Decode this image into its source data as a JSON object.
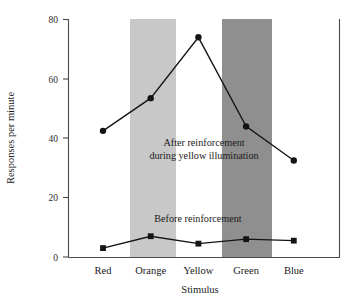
{
  "chart_data": {
    "type": "line",
    "title": "",
    "xlabel": "Stimulus",
    "ylabel": "Responses per minute",
    "categories": [
      "Red",
      "Orange",
      "Yellow",
      "Green",
      "Blue"
    ],
    "ylim": [
      0,
      80
    ],
    "yticks": [
      0,
      20,
      40,
      60,
      80
    ],
    "ytick_labels": [
      "0",
      "20",
      "40",
      "60",
      "80"
    ],
    "grid": false,
    "legend": "inline-annotations",
    "series": [
      {
        "name": "After reinforcement during yellow illumination",
        "marker": "circle",
        "values": [
          42.5,
          53.5,
          74.0,
          44.0,
          32.5
        ]
      },
      {
        "name": "Before reinforcement",
        "marker": "square",
        "values": [
          3.0,
          7.0,
          4.5,
          6.0,
          5.5
        ]
      }
    ],
    "annotations": [
      {
        "id": "after-label-line1",
        "text": "After reinforcement"
      },
      {
        "id": "after-label-line2",
        "text": "during yellow illumination"
      },
      {
        "id": "before-label",
        "text": "Before reinforcement"
      }
    ],
    "bands": [
      {
        "id": "orange-band",
        "category": "Orange",
        "color": "#c8c8c8"
      },
      {
        "id": "green-band",
        "category": "Green",
        "color": "#8f8f8f"
      }
    ],
    "colors": {
      "line": "#141414",
      "axis": "#4a4a4a",
      "band_light": "#c8c8c8",
      "band_dark": "#8f8f8f",
      "background": "#ffffff"
    }
  }
}
